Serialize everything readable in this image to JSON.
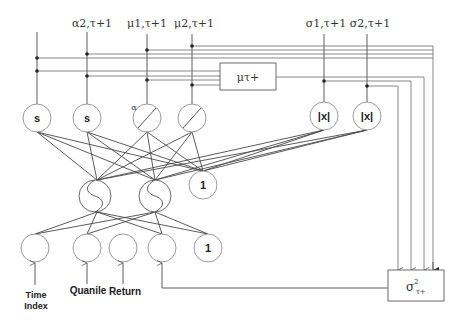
{
  "diagram": {
    "type": "neural-network-architecture",
    "top_inputs": [
      {
        "id": "in0",
        "label": ""
      },
      {
        "id": "in1",
        "label": "α2,τ+1"
      },
      {
        "id": "in2",
        "label": "μ1,τ+1"
      },
      {
        "id": "in3",
        "label": "μ2,τ+1"
      },
      {
        "id": "in4",
        "label": "σ1,τ+1"
      },
      {
        "id": "in5",
        "label": "σ2,τ+1"
      }
    ],
    "mu_box": {
      "label": "μτ+"
    },
    "sigma_box": {
      "label_base": "σ",
      "label_sup": "2",
      "label_sub": "τ+"
    },
    "upper_layer": [
      {
        "id": "u0",
        "symbol": "s",
        "kind": "s"
      },
      {
        "id": "u1",
        "symbol": "s",
        "kind": "s"
      },
      {
        "id": "u2",
        "symbol": "",
        "kind": "linear",
        "annotation": "α"
      },
      {
        "id": "u3",
        "symbol": "",
        "kind": "linear"
      },
      {
        "id": "u4",
        "symbol": "|x|",
        "kind": "abs"
      },
      {
        "id": "u5",
        "symbol": "|x|",
        "kind": "abs"
      }
    ],
    "hidden_layer": [
      {
        "id": "h0",
        "kind": "sigmoid"
      },
      {
        "id": "h1",
        "kind": "sigmoid"
      },
      {
        "id": "hb",
        "kind": "bias",
        "symbol": "1"
      }
    ],
    "input_layer": [
      {
        "id": "i0",
        "symbol": "",
        "label": "Time Index",
        "label_lines": [
          "Time",
          "Index"
        ]
      },
      {
        "id": "i1",
        "symbol": "",
        "label": "Quanile",
        "label_lines": [
          "Quanile"
        ]
      },
      {
        "id": "i2",
        "symbol": "",
        "label": "Return",
        "label_lines": [
          "Return"
        ]
      },
      {
        "id": "i3",
        "symbol": "",
        "label": "",
        "label_lines": []
      },
      {
        "id": "ib",
        "symbol": "1",
        "label": "",
        "label_lines": []
      }
    ]
  }
}
